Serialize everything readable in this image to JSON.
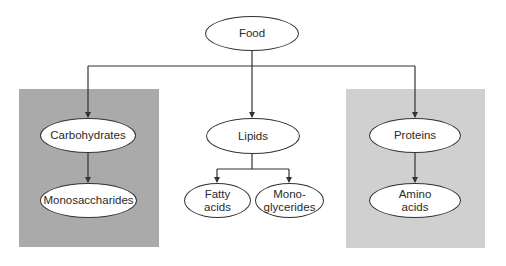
{
  "colors": {
    "carbohydrate_panel": "#aaaaaa",
    "protein_panel": "#d0d0d0",
    "line": "#333333",
    "node_fill": "#ffffff"
  },
  "nodes": {
    "food": "Food",
    "carbohydrates": "Carbohydrates",
    "monosaccharides": "Monosaccharides",
    "lipids": "Lipids",
    "fatty_acids": "Fatty\nacids",
    "monoglycerides": "Mono-\nglycerides",
    "proteins": "Proteins",
    "amino_acids": "Amino\nacids"
  },
  "edges": [
    {
      "from": "food",
      "to": "carbohydrates"
    },
    {
      "from": "food",
      "to": "lipids"
    },
    {
      "from": "food",
      "to": "proteins"
    },
    {
      "from": "carbohydrates",
      "to": "monosaccharides"
    },
    {
      "from": "lipids",
      "to": "fatty_acids"
    },
    {
      "from": "lipids",
      "to": "monoglycerides"
    },
    {
      "from": "proteins",
      "to": "amino_acids"
    }
  ]
}
